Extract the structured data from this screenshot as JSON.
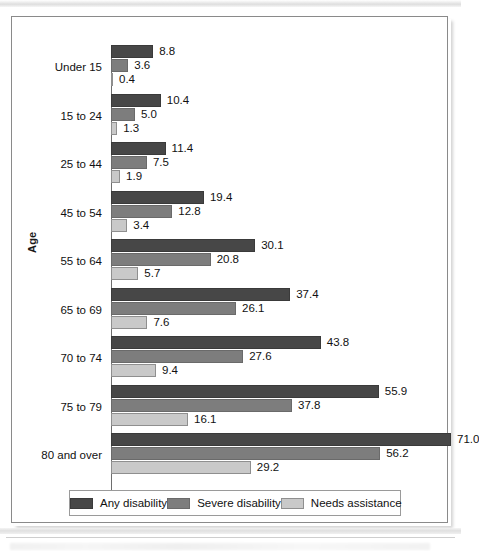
{
  "chart_data": {
    "type": "bar",
    "orientation": "horizontal",
    "title": "",
    "xlabel": "",
    "ylabel": "Age",
    "grid": false,
    "legend_position": "bottom",
    "xlim": [
      0,
      80
    ],
    "categories": [
      "Under 15",
      "15 to 24",
      "25 to 44",
      "45 to 54",
      "55 to 64",
      "65 to 69",
      "70 to 74",
      "75 to 79",
      "80 and over"
    ],
    "series": [
      {
        "name": "Any disability",
        "color": "#474747",
        "values": [
          8.8,
          10.4,
          11.4,
          19.4,
          30.1,
          37.4,
          43.8,
          55.9,
          71.0
        ]
      },
      {
        "name": "Severe disability",
        "color": "#7d7d7d",
        "values": [
          3.6,
          5.0,
          7.5,
          12.8,
          20.8,
          26.1,
          27.6,
          37.8,
          56.2
        ]
      },
      {
        "name": "Needs assistance",
        "color": "#c9c9c9",
        "values": [
          0.4,
          1.3,
          1.9,
          3.4,
          5.7,
          7.6,
          9.4,
          16.1,
          29.2
        ]
      }
    ],
    "value_labels": [
      [
        "8.8",
        "3.6",
        "0.4"
      ],
      [
        "10.4",
        "5.0",
        "1.3"
      ],
      [
        "11.4",
        "7.5",
        "1.9"
      ],
      [
        "19.4",
        "12.8",
        "3.4"
      ],
      [
        "30.1",
        "20.8",
        "5.7"
      ],
      [
        "37.4",
        "26.1",
        "7.6"
      ],
      [
        "43.8",
        "27.6",
        "9.4"
      ],
      [
        "55.9",
        "37.8",
        "16.1"
      ],
      [
        "71.0",
        "56.2",
        "29.2"
      ]
    ]
  }
}
